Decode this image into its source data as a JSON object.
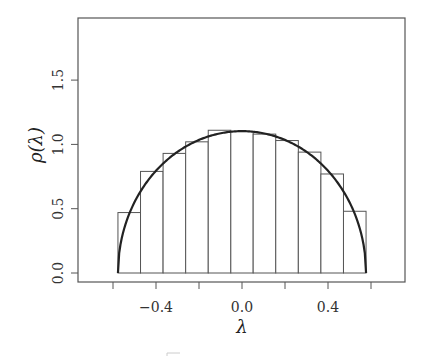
{
  "chart_data": {
    "type": "bar",
    "subtype": "histogram_with_density_curve",
    "title": "",
    "xlabel": "λ",
    "ylabel": "ρ(λ)",
    "xlim": [
      -0.76,
      0.76
    ],
    "ylim": [
      -0.07,
      1.98
    ],
    "grid": false,
    "legend": null,
    "x_ticks": [
      -0.6,
      -0.4,
      -0.2,
      0.0,
      0.2,
      0.4,
      0.6
    ],
    "x_tick_labels": [
      {
        "value": -0.4,
        "label": "−0.4"
      },
      {
        "value": 0.0,
        "label": "0.0"
      },
      {
        "value": 0.4,
        "label": "0.4"
      }
    ],
    "y_ticks": [
      0.0,
      0.5,
      1.0,
      1.5
    ],
    "y_tick_labels": [
      {
        "value": 0.0,
        "label": "0.0"
      },
      {
        "value": 0.5,
        "label": "0.5"
      },
      {
        "value": 1.0,
        "label": "1.0"
      },
      {
        "value": 1.5,
        "label": "1.5"
      }
    ],
    "histogram": {
      "bin_edges": [
        -0.577,
        -0.472,
        -0.367,
        -0.262,
        -0.157,
        -0.052,
        0.052,
        0.157,
        0.262,
        0.367,
        0.472,
        0.577
      ],
      "values": [
        0.47,
        0.79,
        0.93,
        1.02,
        1.11,
        1.1,
        1.08,
        1.03,
        0.94,
        0.77,
        0.48
      ],
      "fill": "#ffffff",
      "edge_color": "#555555"
    },
    "density_curve": {
      "name": "semicircle law",
      "support": [
        -0.577,
        0.577
      ],
      "peak": 1.103,
      "color": "#222222"
    }
  }
}
